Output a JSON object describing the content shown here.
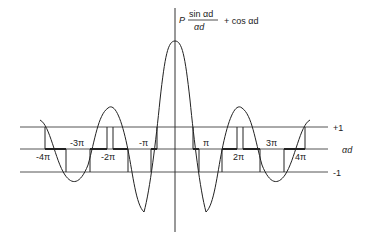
{
  "figure": {
    "formula": {
      "prefix": "P",
      "numerator": "sin αd",
      "denominator": "αd",
      "suffix": "+ cos αd"
    },
    "axis_label": "αd",
    "level_labels": {
      "plus": "+1",
      "minus": "-1"
    },
    "tick_labels": [
      "-4π",
      "-3π",
      "-2π",
      "-π",
      "π",
      "2π",
      "3π",
      "4π"
    ],
    "colors": {
      "line": "#222222",
      "grid": "#555555",
      "background": "#ffffff"
    }
  }
}
